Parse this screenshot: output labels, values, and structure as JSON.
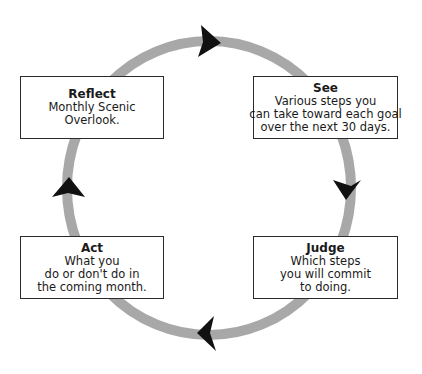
{
  "diagram": {
    "type": "cycle",
    "ring_color": "#a8a8a8",
    "arrow_color": "#111111",
    "direction": "clockwise",
    "stages": [
      {
        "id": "see",
        "title": "See",
        "lines": [
          "Various steps you",
          "can take toward each goal",
          "over the next 30 days."
        ]
      },
      {
        "id": "judge",
        "title": "Judge",
        "lines": [
          "Which steps",
          "you will commit",
          "to doing."
        ]
      },
      {
        "id": "act",
        "title": "Act",
        "lines": [
          "What you",
          "do or don't do in",
          "the coming month."
        ]
      },
      {
        "id": "reflect",
        "title": "Reflect",
        "lines": [
          "Monthly Scenic",
          "Overlook."
        ]
      }
    ]
  }
}
